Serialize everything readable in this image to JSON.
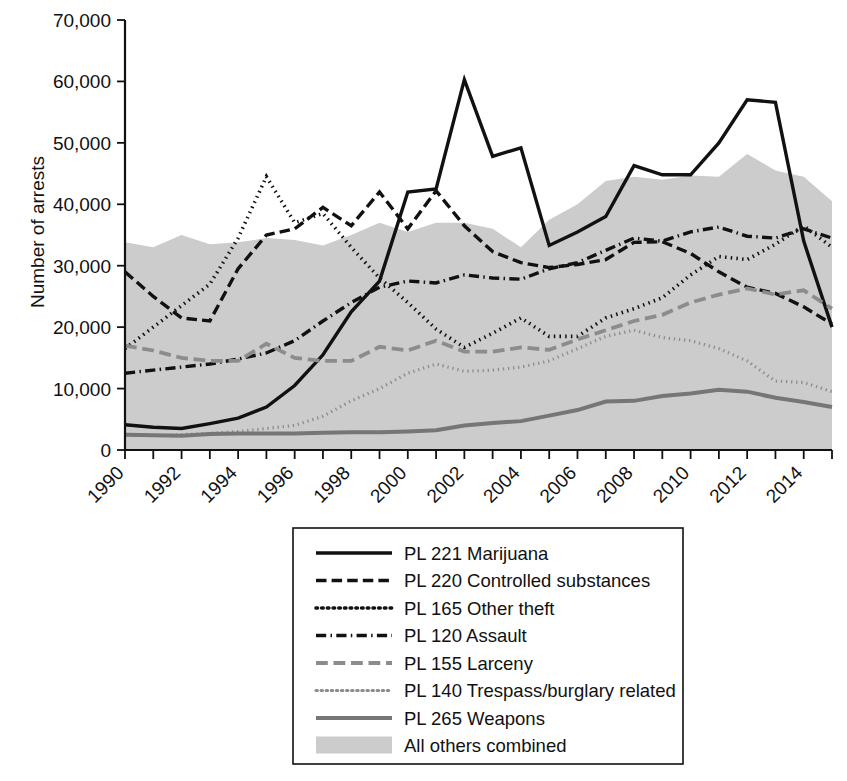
{
  "chart_data": {
    "type": "line",
    "title": "",
    "xlabel": "",
    "ylabel": "Number of arrests",
    "xlim": [
      1990,
      2015
    ],
    "ylim": [
      0,
      70000
    ],
    "grid": false,
    "legend_position": "below-center",
    "ytick_labels": [
      "70,000",
      "60,000",
      "50,000",
      "40,000",
      "30,000",
      "20,000",
      "10,000",
      "0"
    ],
    "ytick_values": [
      70000,
      60000,
      50000,
      40000,
      30000,
      20000,
      10000,
      0
    ],
    "xtick_labels": [
      "1990",
      "1992",
      "1994",
      "1996",
      "1998",
      "2000",
      "2002",
      "2004",
      "2006",
      "2008",
      "2010",
      "2012",
      "2014"
    ],
    "xtick_values": [
      1990,
      1992,
      1994,
      1996,
      1998,
      2000,
      2002,
      2004,
      2006,
      2008,
      2010,
      2012,
      2014
    ],
    "x": [
      1990,
      1991,
      1992,
      1993,
      1994,
      1995,
      1996,
      1997,
      1998,
      1999,
      2000,
      2001,
      2002,
      2003,
      2004,
      2005,
      2006,
      2007,
      2008,
      2009,
      2010,
      2011,
      2012,
      2013,
      2014,
      2015
    ],
    "series": [
      {
        "name": "PL 221 Marijuana",
        "style": "solid",
        "color": "#111111",
        "width": 3.4,
        "values": [
          4100,
          3700,
          3500,
          4300,
          5200,
          7000,
          10500,
          15500,
          22500,
          27500,
          42000,
          42500,
          60300,
          47800,
          49200,
          33300,
          35500,
          38000,
          46300,
          44800,
          44800,
          50000,
          57000,
          56600,
          34000,
          20000
        ]
      },
      {
        "name": "PL 220 Controlled substances",
        "style": "dashed",
        "color": "#111111",
        "width": 3.4,
        "values": [
          29000,
          25000,
          21500,
          21000,
          29500,
          35000,
          36000,
          39500,
          36500,
          42000,
          36000,
          42200,
          36500,
          32300,
          30500,
          29700,
          30200,
          31000,
          33800,
          33900,
          32000,
          29000,
          26500,
          25500,
          23300,
          20500
        ]
      },
      {
        "name": "PL 165 Other theft",
        "style": "dotted",
        "color": "#111111",
        "width": 3.6,
        "values": [
          16500,
          20000,
          23500,
          27000,
          34500,
          44500,
          37000,
          38500,
          33000,
          28000,
          24000,
          19700,
          16700,
          19000,
          21500,
          18500,
          18500,
          21500,
          23000,
          24800,
          28500,
          31500,
          31000,
          33500,
          36500,
          33000
        ]
      },
      {
        "name": "PL 120 Assault",
        "style": "dashdot",
        "color": "#111111",
        "width": 3.4,
        "values": [
          12500,
          13000,
          13500,
          14000,
          14800,
          15800,
          17800,
          21000,
          24000,
          26500,
          27500,
          27200,
          28500,
          28000,
          27800,
          29500,
          30500,
          32500,
          34500,
          34000,
          35500,
          36300,
          34800,
          34500,
          36000,
          34500
        ]
      },
      {
        "name": "PL 155 Larceny",
        "style": "dashed",
        "color": "#8c8c8c",
        "width": 3.8,
        "values": [
          17000,
          16200,
          15000,
          14500,
          14500,
          17300,
          15000,
          14500,
          14500,
          16800,
          16200,
          17800,
          16000,
          16000,
          16700,
          16300,
          18000,
          19500,
          21000,
          22000,
          24000,
          25300,
          26300,
          25300,
          26000,
          23000
        ]
      },
      {
        "name": "PL 140 Trespass/burglary related",
        "style": "dotted",
        "color": "#8c8c8c",
        "width": 3.2,
        "values": [
          2600,
          2300,
          2500,
          2700,
          3000,
          3500,
          4000,
          5500,
          8000,
          10000,
          12500,
          14000,
          12800,
          13000,
          13500,
          14500,
          16500,
          18500,
          19500,
          18300,
          17800,
          16500,
          14500,
          11200,
          11000,
          9500
        ]
      },
      {
        "name": "PL 265 Weapons",
        "style": "solid",
        "color": "#767676",
        "width": 4.0,
        "values": [
          2500,
          2400,
          2300,
          2600,
          2700,
          2700,
          2700,
          2800,
          2900,
          2900,
          3000,
          3200,
          4000,
          4400,
          4700,
          5600,
          6500,
          7900,
          8000,
          8800,
          9200,
          9800,
          9500,
          8500,
          7800,
          7000
        ]
      }
    ],
    "area_series": {
      "name": "All others  combined",
      "style": "filled-area",
      "color": "#cccccc",
      "values": [
        33800,
        33000,
        35000,
        33500,
        33800,
        34500,
        34200,
        33300,
        35000,
        37000,
        35500,
        37000,
        37000,
        36000,
        33000,
        37500,
        40000,
        43800,
        44500,
        44000,
        44700,
        44500,
        48200,
        45500,
        44500,
        40500
      ]
    }
  },
  "legend": {
    "items": [
      {
        "label": "PL 221 Marijuana"
      },
      {
        "label": "PL 220 Controlled substances"
      },
      {
        "label": "PL 165 Other theft"
      },
      {
        "label": "PL 120 Assault"
      },
      {
        "label": "PL 155 Larceny"
      },
      {
        "label": "PL 140 Trespass/burglary related"
      },
      {
        "label": "PL 265 Weapons"
      },
      {
        "label": "All others  combined"
      }
    ]
  }
}
